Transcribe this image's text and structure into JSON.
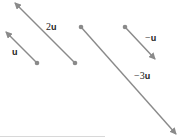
{
  "diagram": {
    "title": "",
    "colors": {
      "vector": "#8a8a8a",
      "dot": "#8a8a8a",
      "label": "#222222"
    },
    "vectors": [
      {
        "id": "u",
        "coef": "",
        "var": "u",
        "tail": [
          37,
          63
        ],
        "tip": [
          6,
          32
        ]
      },
      {
        "id": "2u",
        "coef": "2",
        "var": "u",
        "tail": [
          75,
          63
        ],
        "tip": [
          15,
          3
        ]
      },
      {
        "id": "-3u",
        "coef": "−3",
        "var": "u",
        "tail": [
          81,
          27
        ],
        "tip": [
          176,
          134
        ]
      },
      {
        "id": "-u",
        "coef": "−",
        "var": "u",
        "tail": [
          125,
          27
        ],
        "tip": [
          155,
          59
        ]
      }
    ]
  }
}
